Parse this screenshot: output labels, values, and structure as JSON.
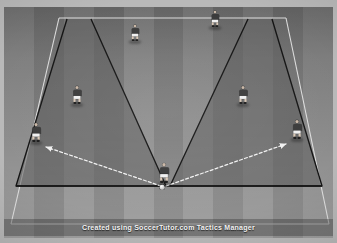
{
  "app": {
    "title": "Soccer Tactics Diagram",
    "caption": "Created using SoccerTutor.com Tactics Manager"
  },
  "colors": {
    "frame": "#b9b9b9",
    "pitch_base": "#7e7e7e",
    "stripe_light": "#8e8e8e",
    "stripe_dark": "#797979",
    "zone_fill": "#5f5f5f",
    "zone_stroke": "#121212",
    "pitch_line": "#e8e8e8",
    "arrow": "#f2f2f2",
    "shirt_dark": "#3a3a3a",
    "shorts": "#f0f0f0",
    "ball": "#ffffff"
  },
  "pitch": {
    "stripe_count": 11,
    "lines": [
      {
        "name": "top-touchline",
        "x1": 59,
        "y1": 18,
        "x2": 286,
        "y2": 18
      },
      {
        "name": "bottom-touchline",
        "x1": 11,
        "y1": 224,
        "x2": 329,
        "y2": 224
      },
      {
        "name": "left-sideline",
        "x1": 11,
        "y1": 224,
        "x2": 59,
        "y2": 18
      },
      {
        "name": "right-sideline",
        "x1": 329,
        "y1": 224,
        "x2": 286,
        "y2": 18
      }
    ]
  },
  "zones": [
    {
      "name": "left-channel-zone",
      "points": "67,19 91,19 166,186 16,186",
      "label": "left shaded channel"
    },
    {
      "name": "right-channel-zone",
      "points": "248,19 272,19 322,186 170,186",
      "label": "right shaded channel"
    }
  ],
  "zone_outline": {
    "left": "67,19 16,186 166,186 91,19",
    "right": "248,19 170,186 322,186 272,19",
    "base_line": {
      "x1": 16,
      "y1": 186,
      "x2": 322,
      "y2": 186
    }
  },
  "players": [
    {
      "id": "p1",
      "name": "player-top-center",
      "x": 135,
      "y": 41,
      "shirt": "#3a3a3a",
      "scale": 0.9
    },
    {
      "id": "p2",
      "name": "player-top-right",
      "x": 215,
      "y": 27,
      "shirt": "#3a3a3a",
      "scale": 0.9
    },
    {
      "id": "p3",
      "name": "player-mid-left",
      "x": 77,
      "y": 104,
      "shirt": "#3a3a3a",
      "scale": 1.0
    },
    {
      "id": "p4",
      "name": "player-mid-right",
      "x": 243,
      "y": 104,
      "shirt": "#3a3a3a",
      "scale": 1.0
    },
    {
      "id": "p5",
      "name": "player-wide-left",
      "x": 36,
      "y": 142,
      "shirt": "#3a3a3a",
      "scale": 1.05
    },
    {
      "id": "p6",
      "name": "player-wide-right",
      "x": 297,
      "y": 139,
      "shirt": "#3a3a3a",
      "scale": 1.05
    },
    {
      "id": "p7",
      "name": "player-center-ball-carrier",
      "x": 164,
      "y": 183,
      "shirt": "#3a3a3a",
      "scale": 1.1
    }
  ],
  "ball": {
    "name": "soccer-ball",
    "x": 162,
    "y": 187
  },
  "passes": [
    {
      "name": "pass-arrow-left",
      "from_player": "player-center-ball-carrier",
      "to_player": "player-wide-left",
      "x1": 161,
      "y1": 186,
      "x2": 44,
      "y2": 146,
      "style": "dashed",
      "head": true
    },
    {
      "name": "pass-arrow-right",
      "from_player": "player-center-ball-carrier",
      "to_player": "player-wide-right",
      "x1": 166,
      "y1": 186,
      "x2": 288,
      "y2": 143,
      "style": "dashed",
      "head": true
    }
  ]
}
